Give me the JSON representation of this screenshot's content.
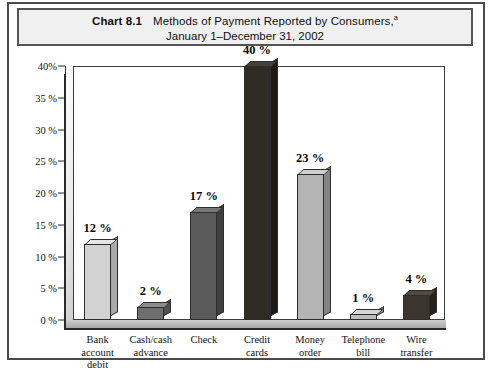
{
  "figure": {
    "chart_number": "Chart 8.1",
    "title_line_1": "Methods of Payment Reported by Consumers,",
    "title_superscript": "a",
    "title_line_2": "January 1–December 31, 2002"
  },
  "chart_data": {
    "type": "bar",
    "xlabel": "",
    "ylabel": "",
    "ylim": [
      0,
      40
    ],
    "grid": false,
    "legend": "none",
    "categories": [
      "Bank account debit",
      "Cash/cash advance",
      "Check",
      "Credit cards",
      "Money order",
      "Telephone bill",
      "Wire transfer"
    ],
    "category_lines": [
      [
        "Bank",
        "account",
        "debit"
      ],
      [
        "Cash/cash",
        "advance"
      ],
      [
        "Check"
      ],
      [
        "Credit",
        "cards"
      ],
      [
        "Money",
        "order"
      ],
      [
        "Telephone",
        "bill"
      ],
      [
        "Wire",
        "transfer"
      ]
    ],
    "values": [
      12,
      2,
      17,
      40,
      23,
      1,
      4
    ],
    "value_labels": [
      "12 %",
      "2 %",
      "17 %",
      "40 %",
      "23 %",
      "1 %",
      "4 %"
    ],
    "bar_colors": [
      "#d2d2d2",
      "#6e6e6e",
      "#5b5b5b",
      "#2f2c26",
      "#b4b4b4",
      "#bdbdbd",
      "#3a352e"
    ],
    "bar_side_colors": [
      "#a9a9a9",
      "#4f4f4f",
      "#3f3f3f",
      "#1c1a16",
      "#848484",
      "#8e8e8e",
      "#252119"
    ],
    "bar_top_colors": [
      "#e6e6e6",
      "#8a8a8a",
      "#767676",
      "#44403a",
      "#cfcfcf",
      "#d6d6d6",
      "#514a41"
    ],
    "y_ticks": [
      0,
      5,
      10,
      15,
      20,
      25,
      30,
      35,
      40
    ],
    "y_tick_labels": [
      "0 %",
      "5 %",
      "10 %",
      "15 %",
      "20 %",
      "25 %",
      "30 %",
      "35 %",
      "40%"
    ]
  },
  "colors": {
    "frame": "#4a4a4a",
    "title_band_background": "#f0f0f0",
    "axis": "#2a2a2a",
    "text": "#111111"
  }
}
